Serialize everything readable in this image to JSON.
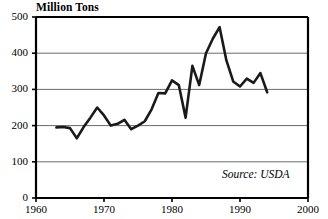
{
  "chart_data": {
    "type": "line",
    "title": "Million Tons",
    "xlabel": "",
    "ylabel": "Million Tons",
    "xlim": [
      1960,
      2000
    ],
    "ylim": [
      0,
      500
    ],
    "yticks": [
      0,
      100,
      200,
      300,
      400,
      500
    ],
    "xticks": [
      1960,
      1970,
      1980,
      1990,
      2000
    ],
    "grid": "horizontal",
    "legend": "none",
    "annotations": [
      "Source: USDA"
    ],
    "series": [
      {
        "name": "Production",
        "x": [
          1963,
          1964,
          1965,
          1966,
          1967,
          1968,
          1969,
          1970,
          1971,
          1972,
          1973,
          1974,
          1975,
          1976,
          1977,
          1978,
          1979,
          1980,
          1981,
          1982,
          1983,
          1984,
          1985,
          1986,
          1987,
          1988,
          1989,
          1990,
          1991,
          1992,
          1993,
          1994
        ],
        "values": [
          195,
          196,
          193,
          165,
          196,
          222,
          250,
          228,
          200,
          205,
          216,
          190,
          200,
          212,
          245,
          290,
          289,
          325,
          312,
          222,
          365,
          312,
          400,
          440,
          472,
          380,
          322,
          308,
          330,
          318,
          345,
          292
        ]
      }
    ]
  },
  "labels": {
    "y": [
      "500",
      "400",
      "300",
      "200",
      "100",
      "0"
    ],
    "x": [
      "1960",
      "1970",
      "1980",
      "1990",
      "2000"
    ]
  },
  "source": {
    "text": "Source: USDA"
  },
  "axis_title": {
    "text": "Million Tons"
  },
  "style": {
    "line_color": "#1a1a1a",
    "grid_color": "#6b6b6b",
    "axis_color": "#000000"
  }
}
